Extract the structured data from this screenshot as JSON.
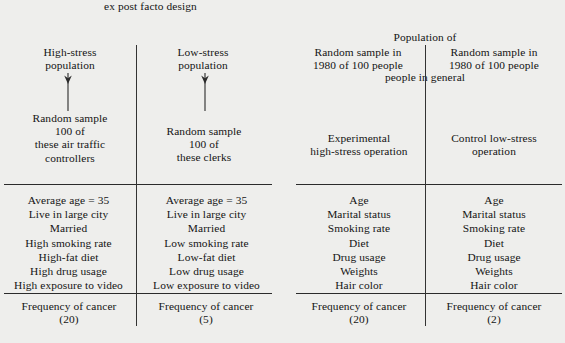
{
  "diagram": {
    "titles": {
      "left": "ex post facto design",
      "right_line1": "Population of",
      "right_line2": "people in general"
    },
    "columns": [
      {
        "id": "high-stress-population",
        "header": "High-stress\npopulation",
        "arrow": "down-arrow",
        "sampling": "Random sample\n100 of\nthese air traffic\ncontrollers",
        "attributes": "Average age = 35\nLive in large city\nMarried\nHigh smoking rate\nHigh-fat diet\nHigh drug usage\nHigh exposure to video",
        "outcome": "Frequency of cancer\n(20)"
      },
      {
        "id": "low-stress-population",
        "header": "Low-stress\npopulation",
        "arrow": "down-arrow",
        "sampling": "Random sample\n100 of\nthese clerks",
        "attributes": "Average age = 35\nLive in large city\nMarried\nLow smoking rate\nLow-fat diet\nLow drug usage\nLow exposure to video",
        "outcome": "Frequency of cancer\n(5)"
      },
      {
        "id": "experimental-group",
        "header": "Random sample in\n1980 of 100 people",
        "arrow": null,
        "sampling": "Experimental\nhigh-stress operation",
        "attributes": "Age\nMarital status\nSmoking rate\nDiet\nDrug usage\nWeights\nHair color",
        "outcome": "Frequency of cancer\n(20)"
      },
      {
        "id": "control-group",
        "header": "Random sample in\n1980 of 100 people",
        "arrow": null,
        "sampling": "Control low-stress\noperation",
        "attributes": "Age\nMarital status\nSmoking rate\nDiet\nDrug usage\nWeights\nHair color",
        "outcome": "Frequency of cancer\n(2)"
      }
    ],
    "colors": {
      "background": "#eeeeec",
      "ink": "#141414",
      "rule": "#2b2b2b"
    }
  }
}
